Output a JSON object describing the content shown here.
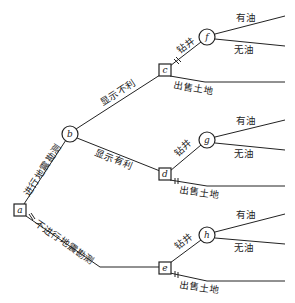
{
  "diagram": {
    "type": "decision-tree",
    "nodes": {
      "a": {
        "label": "a",
        "kind": "decision"
      },
      "b": {
        "label": "b",
        "kind": "chance"
      },
      "c": {
        "label": "c",
        "kind": "decision"
      },
      "d": {
        "label": "d",
        "kind": "decision"
      },
      "e": {
        "label": "e",
        "kind": "decision"
      },
      "f": {
        "label": "f",
        "kind": "chance"
      },
      "g": {
        "label": "g",
        "kind": "chance"
      },
      "h": {
        "label": "h",
        "kind": "chance"
      }
    },
    "edges": {
      "a_b": "进行地震勘测",
      "a_e": "不进行地震勘测",
      "b_c": "显示不利",
      "b_d": "显示有利",
      "c_f": "钻井",
      "c_sell": "出售土地",
      "d_g": "钻井",
      "d_sell": "出售土地",
      "e_h": "钻井",
      "e_sell": "出售土地",
      "f_oil": "有油",
      "f_nooil": "无油",
      "g_oil": "有油",
      "g_nooil": "无油",
      "h_oil": "有油",
      "h_nooil": "无油"
    }
  }
}
